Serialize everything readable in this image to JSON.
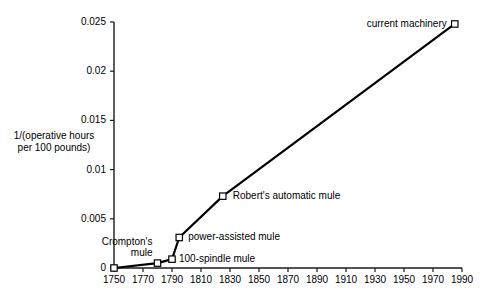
{
  "chart_data": {
    "type": "line",
    "title": "",
    "xlabel": "",
    "ylabel": "1/(operative hours per 100 pounds)",
    "ylabel_line1": "1/(operative hours",
    "ylabel_line2": "per 100 pounds)",
    "xlim": [
      1750,
      1990
    ],
    "ylim": [
      0,
      0.025
    ],
    "grid": false,
    "legend": "none",
    "xticks": [
      1750,
      1770,
      1790,
      1810,
      1830,
      1850,
      1870,
      1890,
      1910,
      1930,
      1950,
      1970,
      1990
    ],
    "xtick_labels": [
      "1750",
      "1770",
      "1790",
      "1810",
      "1830",
      "1850",
      "1870",
      "1890",
      "1910",
      "1930",
      "1950",
      "1970",
      "1990"
    ],
    "yticks": [
      0,
      0.005,
      0.01,
      0.015,
      0.02,
      0.025
    ],
    "ytick_labels": [
      "0",
      "0.005",
      "0.01",
      "0.015",
      "0.02",
      "0.025"
    ],
    "series": [
      {
        "name": "spinning productivity",
        "marker": "open-square",
        "line_color": "#000000",
        "x": [
          1750,
          1780,
          1790,
          1795,
          1825,
          1985
        ],
        "y": [
          0.0,
          0.0005,
          0.0009,
          0.0031,
          0.0073,
          0.0248
        ]
      }
    ],
    "annotations": [
      {
        "text": "Crompton's mule",
        "text_line1": "Crompton's",
        "text_line2": "mule",
        "x": 1780,
        "y": 0.0005,
        "align": "left"
      },
      {
        "text": "100-spindle mule",
        "x": 1790,
        "y": 0.0009,
        "align": "right"
      },
      {
        "text": "power-assisted mule",
        "x": 1795,
        "y": 0.0031,
        "align": "right"
      },
      {
        "text": "Robert's automatic mule",
        "x": 1825,
        "y": 0.0073,
        "align": "right"
      },
      {
        "text": "current machinery",
        "x": 1985,
        "y": 0.0248,
        "align": "left"
      }
    ]
  }
}
